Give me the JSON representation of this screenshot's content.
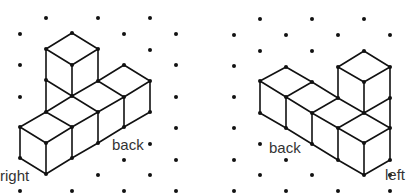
{
  "figures": [
    {
      "name": "left-view",
      "labels": {
        "corner": "right",
        "side": "back"
      }
    },
    {
      "name": "right-view",
      "labels": {
        "side": "back",
        "corner": "left"
      }
    }
  ],
  "colors": {
    "line": "#111111",
    "dot": "#111111",
    "text": "#333333"
  }
}
